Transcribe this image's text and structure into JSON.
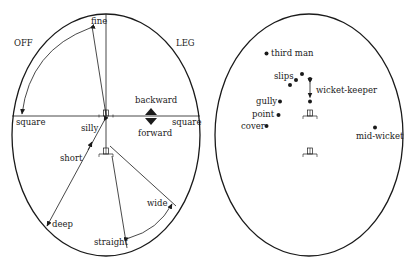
{
  "diagram": {
    "left_field": {
      "side_labels": {
        "off": "OFF",
        "leg": "LEG"
      },
      "axis_labels": {
        "fine": "fine",
        "square_left": "square",
        "square_right": "square",
        "backward": "backward",
        "forward": "forward",
        "silly": "silly",
        "short": "short",
        "deep": "deep",
        "wide": "wide",
        "straight": "straight"
      }
    },
    "right_field": {
      "positions": [
        {
          "name": "third man",
          "x": 266,
          "y": 53
        },
        {
          "name": "slips",
          "x": 296,
          "y": 80
        },
        {
          "name": "wicket-keeper",
          "x": 310,
          "y": 91
        },
        {
          "name": "gully",
          "x": 280,
          "y": 101
        },
        {
          "name": "point",
          "x": 278,
          "y": 115
        },
        {
          "name": "cover",
          "x": 266,
          "y": 126
        },
        {
          "name": "mid-wicket",
          "x": 375,
          "y": 128
        }
      ],
      "labels": {
        "third_man": "third man",
        "slips": "slips",
        "wicket_keeper": "wicket-keeper",
        "gully": "gully",
        "point": "point",
        "cover": "cover",
        "mid_wicket": "mid-wicket"
      }
    }
  }
}
